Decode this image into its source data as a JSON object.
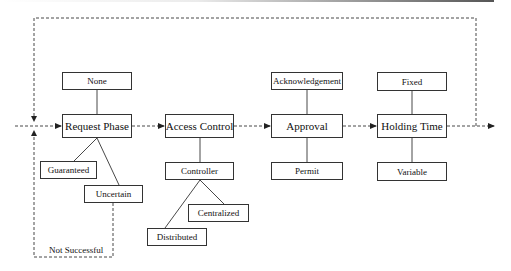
{
  "diagram": {
    "phases": [
      {
        "id": "request",
        "label": "Request Phase",
        "options_above": [
          "None"
        ],
        "options_below": [
          "Guaranteed",
          "Uncertain"
        ]
      },
      {
        "id": "access",
        "label": "Access Control",
        "options_below": [
          "Controller"
        ],
        "sub_options": [
          "Centralized",
          "Distributed"
        ]
      },
      {
        "id": "approval",
        "label": "Approval",
        "options_above": [
          "Acknowledgement"
        ],
        "options_below": [
          "Permit"
        ]
      },
      {
        "id": "holding",
        "label": "Holding Time",
        "options_above": [
          "Fixed"
        ],
        "options_below": [
          "Variable"
        ]
      }
    ],
    "boxes": {
      "none": "None",
      "request_phase": "Request Phase",
      "guaranteed": "Guaranteed",
      "uncertain": "Uncertain",
      "access_control": "Access Control",
      "controller": "Controller",
      "centralized": "Centralized",
      "distributed": "Distributed",
      "acknowledgement": "Acknowledgement",
      "approval": "Approval",
      "permit": "Permit",
      "fixed": "Fixed",
      "holding_time": "Holding Time",
      "variable": "Variable"
    },
    "loop_label": "Not Successful",
    "colors": {
      "stroke": "#333333",
      "background": "#ffffff"
    }
  }
}
